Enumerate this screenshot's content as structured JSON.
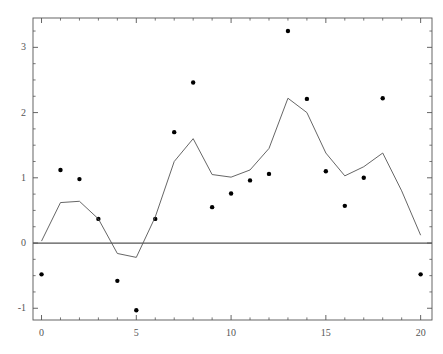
{
  "chart_data": {
    "type": "line",
    "title": "",
    "subtitle": "",
    "xlabel": "",
    "ylabel": "",
    "xlim": [
      -0.45,
      20.6
    ],
    "ylim": [
      -1.18,
      3.45
    ],
    "grid": false,
    "legend_position": "none",
    "x_ticks": [
      0,
      5,
      10,
      15,
      20
    ],
    "x_tick_labels": [
      "0",
      "5",
      "10",
      "15",
      "20"
    ],
    "x_minor_ticks": [
      1,
      2,
      3,
      4,
      6,
      7,
      8,
      9,
      11,
      12,
      13,
      14,
      16,
      17,
      18,
      19
    ],
    "y_ticks": [
      -1,
      0,
      1,
      2,
      3
    ],
    "y_tick_labels": [
      "-1",
      "0",
      "1",
      "2",
      "3"
    ],
    "y_minor_ticks": [
      -0.75,
      -0.5,
      -0.25,
      0.25,
      0.5,
      0.75,
      1.25,
      1.5,
      1.75,
      2.25,
      2.5,
      2.75,
      3.25
    ],
    "zero_line": 0,
    "colors": {
      "line": "#555555",
      "points": "#000000",
      "axis": "#555555",
      "zero_line": "#555555",
      "background": "#ffffff"
    },
    "x": [
      0,
      1,
      2,
      3,
      4,
      5,
      6,
      7,
      8,
      9,
      10,
      11,
      12,
      13,
      14,
      15,
      16,
      17,
      18,
      19,
      20
    ],
    "series": [
      {
        "name": "data points",
        "type": "scatter",
        "marker": "filled-circle",
        "values": [
          -0.48,
          1.12,
          0.98,
          0.37,
          -0.58,
          -1.03,
          0.37,
          1.7,
          2.46,
          0.55,
          0.76,
          0.96,
          1.06,
          3.25,
          2.21,
          1.1,
          0.57,
          1.0,
          2.22,
          null,
          -0.48
        ]
      },
      {
        "name": "smoothed line",
        "type": "line",
        "values": [
          0.03,
          0.62,
          0.64,
          0.37,
          -0.16,
          -0.22,
          0.4,
          1.25,
          1.6,
          1.05,
          1.01,
          1.12,
          1.45,
          2.22,
          2.0,
          1.38,
          1.03,
          1.17,
          1.38,
          0.8,
          0.12
        ]
      }
    ]
  }
}
